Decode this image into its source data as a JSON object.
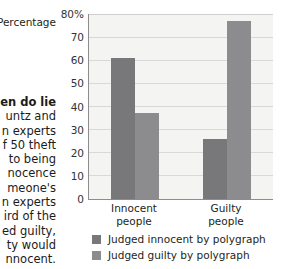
{
  "article": {
    "heading": "en do lie",
    "lines": [
      "untz and",
      "n experts",
      "f 50 theft",
      "to being",
      "nocence",
      "meone's",
      "n experts",
      "ird of the",
      "ed guilty,",
      "ty would",
      "nnocent."
    ]
  },
  "axis_caption": "Percentage",
  "chart_data": {
    "type": "bar",
    "title": "",
    "subtitle": "",
    "xlabel": "",
    "ylabel": "Percentage",
    "categories": [
      "Innocent people",
      "Guilty people"
    ],
    "category_lines": [
      [
        "Innocent",
        "people"
      ],
      [
        "Guilty",
        "people"
      ]
    ],
    "series": [
      {
        "name": "Judged innocent by polygraph",
        "values": [
          61,
          26
        ],
        "color": "#78787a"
      },
      {
        "name": "Judged guilty by polygraph",
        "values": [
          37,
          77
        ],
        "color": "#8c8c8e"
      }
    ],
    "ylim": [
      0,
      80
    ],
    "yticks": [
      0,
      10,
      20,
      30,
      40,
      50,
      60,
      70,
      80
    ],
    "ytick_labels": [
      "0",
      "10",
      "20",
      "30",
      "40",
      "50",
      "60",
      "70",
      "80%"
    ],
    "grid": true,
    "grid_axis": "y",
    "legend_position": "bottom-left",
    "plot_background": "#f4f4f2",
    "axis_color": "#8d8d8d",
    "grid_color": "#d9d9d7"
  }
}
